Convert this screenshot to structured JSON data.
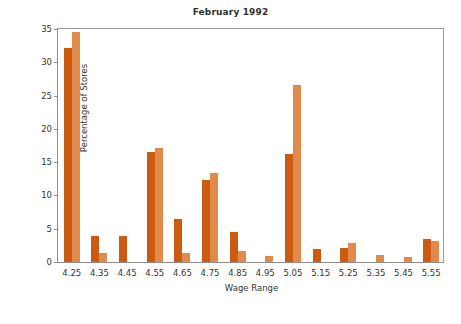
{
  "chart_data": {
    "type": "bar",
    "title": "February 1992",
    "xlabel": "Wage Range",
    "ylabel": "Percentage of Stores",
    "categories": [
      "4.25",
      "4.35",
      "4.45",
      "4.55",
      "4.65",
      "4.75",
      "4.85",
      "4.95",
      "5.05",
      "5.15",
      "5.25",
      "5.35",
      "5.45",
      "5.55"
    ],
    "series": [
      {
        "name": "series-1",
        "color": "#CC5A10",
        "values": [
          32.2,
          3.9,
          3.9,
          16.6,
          6.5,
          12.3,
          4.5,
          0.0,
          16.3,
          2.0,
          2.1,
          0.0,
          0.0,
          3.4
        ]
      },
      {
        "name": "series-2",
        "color": "#E08A4C",
        "values": [
          34.5,
          1.3,
          0.0,
          17.2,
          1.4,
          13.4,
          1.6,
          0.9,
          26.6,
          0.0,
          2.9,
          1.1,
          0.8,
          3.1
        ]
      }
    ],
    "ylim": [
      0,
      35
    ],
    "yticks": [
      0,
      5,
      10,
      15,
      20,
      25,
      30,
      35
    ],
    "ytick_labels": [
      "0",
      "5",
      "10",
      "15",
      "20",
      "25",
      "30",
      "35"
    ],
    "grid": false,
    "legend": "none",
    "background": "#ffffff",
    "axis_color": "#8d8d8d"
  }
}
